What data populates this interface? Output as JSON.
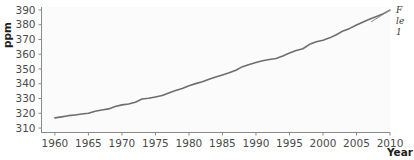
{
  "chart_data": {
    "type": "line",
    "title": "",
    "xlabel": "Year",
    "ylabel": "ppm",
    "xlim": [
      1958,
      2010
    ],
    "ylim": [
      307,
      392
    ],
    "grid": false,
    "legend": "none",
    "x_ticks": [
      "1960",
      "1965",
      "1970",
      "1975",
      "1980",
      "1985",
      "1990",
      "1995",
      "2000",
      "2005",
      "2010"
    ],
    "y_ticks": [
      "310",
      "320",
      "330",
      "340",
      "350",
      "360",
      "370",
      "380",
      "390"
    ],
    "series": [
      {
        "name": "Atmospheric CO2 concentration",
        "color": "#6e6e6e",
        "x": [
          1960,
          1961,
          1962,
          1963,
          1964,
          1965,
          1966,
          1967,
          1968,
          1969,
          1970,
          1971,
          1972,
          1973,
          1974,
          1975,
          1976,
          1977,
          1978,
          1979,
          1980,
          1981,
          1982,
          1983,
          1984,
          1985,
          1986,
          1987,
          1988,
          1989,
          1990,
          1991,
          1992,
          1993,
          1994,
          1995,
          1996,
          1997,
          1998,
          1999,
          2000,
          2001,
          2002,
          2003,
          2004,
          2005,
          2006,
          2007,
          2008,
          2009,
          2010
        ],
        "values": [
          316.9,
          317.6,
          318.4,
          318.9,
          319.5,
          320.0,
          321.4,
          322.2,
          323.0,
          324.6,
          325.7,
          326.3,
          327.5,
          329.7,
          330.2,
          331.1,
          332.0,
          333.8,
          335.4,
          336.8,
          338.7,
          340.1,
          341.4,
          343.0,
          344.6,
          346.0,
          347.4,
          349.2,
          351.6,
          353.1,
          354.4,
          355.6,
          356.4,
          357.1,
          358.8,
          360.8,
          362.6,
          363.7,
          366.7,
          368.4,
          369.5,
          371.1,
          373.2,
          375.8,
          377.5,
          379.8,
          381.9,
          383.8,
          385.6,
          387.4,
          389.9
        ]
      }
    ]
  },
  "annotation": {
    "line1": "F",
    "line2": "le",
    "line3": "1"
  }
}
